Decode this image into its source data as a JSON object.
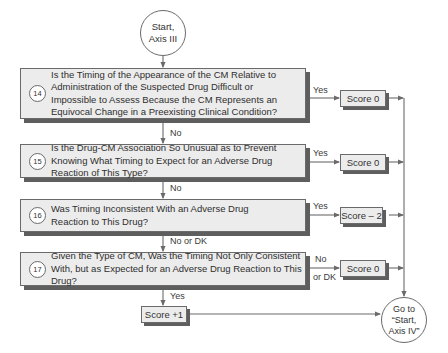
{
  "start": {
    "label": "Start,\nAxis III"
  },
  "end": {
    "label": "Go to\n“Start,\nAxis IV”"
  },
  "questions": [
    {
      "number": "14",
      "text": "Is the Timing of the Appearance of the CM Relative to Administration of the Suspected Drug Difficult or Impossible to Assess Because the CM Represents an Equivocal Change in a Preexisting Clinical Condition?",
      "branch_label": "Yes",
      "score": "Score 0",
      "down_label": "No"
    },
    {
      "number": "15",
      "text": "Is the Drug-CM Association So Unusual as to Prevent Knowing What Timing to Expect for an Adverse Drug Reaction of This Type?",
      "branch_label": "Yes",
      "score": "Score 0",
      "down_label": "No"
    },
    {
      "number": "16",
      "text": "Was Timing Inconsistent With an Adverse Drug Reaction to This Drug?",
      "branch_label": "Yes",
      "score": "Score – 2",
      "down_label": "No or DK"
    },
    {
      "number": "17",
      "text": "Given the Type of CM, Was the Timing Not Only Consistent With, but as Expected for an Adverse Drug Reaction to This Drug?",
      "branch_label_top": "No",
      "branch_label_bottom": "or DK",
      "score": "Score 0",
      "down_label": "Yes"
    }
  ],
  "final_score": "Score +1",
  "colors": {
    "box_fill": "#ececec",
    "shadow": "#5e5e5e",
    "line": "#6a6a6a"
  }
}
